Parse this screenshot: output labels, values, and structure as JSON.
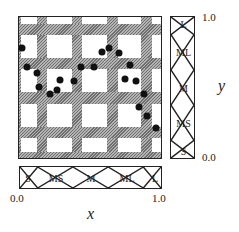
{
  "diagram": {
    "type": "fuzzy-partition-scatter",
    "x_axis": {
      "label": "x",
      "min_label": "0.0",
      "max_label": "1.0",
      "sets": [
        "S",
        "MS",
        "M",
        "ML",
        "L"
      ]
    },
    "y_axis": {
      "label": "y",
      "min_label": "0.0",
      "max_label": "1.0",
      "sets": [
        "S",
        "MS",
        "M",
        "ML",
        "L"
      ]
    },
    "colors": {
      "border": "#222222",
      "hatch_dark": "#6e6e6e",
      "hatch_light": "#b4b4b4",
      "point": "#111111"
    },
    "vertical_bands": [
      {
        "left": 0,
        "width": 2
      },
      {
        "left": 18,
        "width": 10
      },
      {
        "left": 53,
        "width": 10
      },
      {
        "left": 88,
        "width": 11
      },
      {
        "left": 122,
        "width": 11
      }
    ],
    "horizontal_bands": [
      {
        "top": 7,
        "height": 11
      },
      {
        "top": 41,
        "height": 11
      },
      {
        "top": 75,
        "height": 12
      },
      {
        "top": 110,
        "height": 11
      },
      {
        "top": 135,
        "height": 8
      }
    ],
    "points": [
      {
        "x": 0.02,
        "y": 0.78
      },
      {
        "x": 0.06,
        "y": 0.64
      },
      {
        "x": 0.13,
        "y": 0.6
      },
      {
        "x": 0.14,
        "y": 0.5
      },
      {
        "x": 0.22,
        "y": 0.45
      },
      {
        "x": 0.27,
        "y": 0.48
      },
      {
        "x": 0.29,
        "y": 0.55
      },
      {
        "x": 0.39,
        "y": 0.54
      },
      {
        "x": 0.44,
        "y": 0.64
      },
      {
        "x": 0.53,
        "y": 0.64
      },
      {
        "x": 0.59,
        "y": 0.75
      },
      {
        "x": 0.64,
        "y": 0.78
      },
      {
        "x": 0.71,
        "y": 0.74
      },
      {
        "x": 0.79,
        "y": 0.66
      },
      {
        "x": 0.75,
        "y": 0.56
      },
      {
        "x": 0.83,
        "y": 0.54
      },
      {
        "x": 0.89,
        "y": 0.45
      },
      {
        "x": 0.85,
        "y": 0.36
      },
      {
        "x": 0.91,
        "y": 0.29
      },
      {
        "x": 0.97,
        "y": 0.21
      }
    ]
  }
}
